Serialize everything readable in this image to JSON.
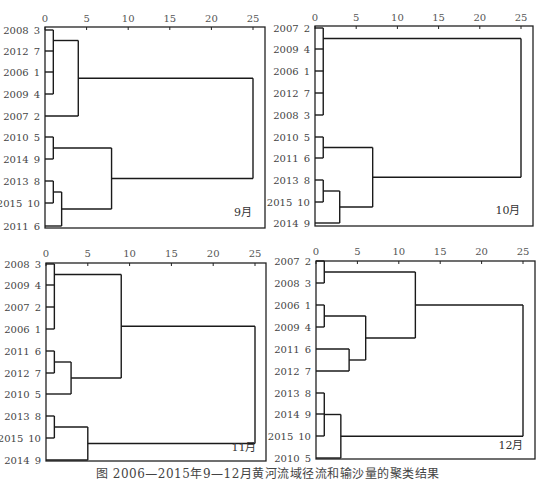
{
  "caption": "图 2006—2015年9—12月黄河流域径流和输沙量的聚类结果",
  "chart_data": [
    {
      "type": "dendrogram",
      "title": "9月",
      "axis_ticks": [
        0,
        5,
        10,
        15,
        20,
        25
      ],
      "xlim": [
        0,
        25
      ],
      "leaves": [
        {
          "year": "2008",
          "id": "3"
        },
        {
          "year": "2012",
          "id": "7"
        },
        {
          "year": "2006",
          "id": "1"
        },
        {
          "year": "2009",
          "id": "4"
        },
        {
          "year": "2007",
          "id": "2"
        },
        {
          "year": "2010",
          "id": "5"
        },
        {
          "year": "2014",
          "id": "9"
        },
        {
          "year": "2013",
          "id": "8"
        },
        {
          "year": "2015",
          "id": "10"
        },
        {
          "year": "2011",
          "id": "6"
        }
      ],
      "merges": [
        {
          "a": "L0",
          "b": "L1",
          "h": 1,
          "also": [
            "L2",
            "L3"
          ]
        },
        {
          "a": "M0",
          "b": "L4",
          "h": 4
        },
        {
          "a": "L5",
          "b": "L6",
          "h": 1
        },
        {
          "a": "L7",
          "b": "L8",
          "h": 1
        },
        {
          "a": "M3",
          "b": "L9",
          "h": 2
        },
        {
          "a": "M2",
          "b": "M4",
          "h": 8
        },
        {
          "a": "M1",
          "b": "M5",
          "h": 25
        }
      ]
    },
    {
      "type": "dendrogram",
      "title": "10月",
      "axis_ticks": [
        0,
        5,
        10,
        15,
        20,
        25
      ],
      "xlim": [
        0,
        25
      ],
      "leaves": [
        {
          "year": "2007",
          "id": "2"
        },
        {
          "year": "2009",
          "id": "4"
        },
        {
          "year": "2006",
          "id": "1"
        },
        {
          "year": "2012",
          "id": "7"
        },
        {
          "year": "2008",
          "id": "3"
        },
        {
          "year": "2010",
          "id": "5"
        },
        {
          "year": "2011",
          "id": "6"
        },
        {
          "year": "2013",
          "id": "8"
        },
        {
          "year": "2015",
          "id": "10"
        },
        {
          "year": "2014",
          "id": "9"
        }
      ],
      "merges": [
        {
          "a": "L0",
          "b": "L1",
          "h": 1,
          "also": [
            "L2",
            "L3",
            "L4"
          ]
        },
        {
          "a": "L5",
          "b": "L6",
          "h": 1
        },
        {
          "a": "L7",
          "b": "L8",
          "h": 1
        },
        {
          "a": "M2",
          "b": "L9",
          "h": 3
        },
        {
          "a": "M1",
          "b": "M3",
          "h": 7
        },
        {
          "a": "M0",
          "b": "M4",
          "h": 25
        }
      ]
    },
    {
      "type": "dendrogram",
      "title": "11月",
      "axis_ticks": [
        0,
        5,
        10,
        15,
        20,
        25
      ],
      "xlim": [
        0,
        25
      ],
      "leaves": [
        {
          "year": "2008",
          "id": "3"
        },
        {
          "year": "2009",
          "id": "4"
        },
        {
          "year": "2007",
          "id": "2"
        },
        {
          "year": "2006",
          "id": "1"
        },
        {
          "year": "2011",
          "id": "6"
        },
        {
          "year": "2012",
          "id": "7"
        },
        {
          "year": "2010",
          "id": "5"
        },
        {
          "year": "2013",
          "id": "8"
        },
        {
          "year": "2015",
          "id": "10"
        },
        {
          "year": "2014",
          "id": "9"
        }
      ],
      "merges": [
        {
          "a": "L0",
          "b": "L1",
          "h": 1,
          "also": [
            "L2",
            "L3"
          ]
        },
        {
          "a": "L4",
          "b": "L5",
          "h": 1
        },
        {
          "a": "M1",
          "b": "L6",
          "h": 3
        },
        {
          "a": "M0",
          "b": "M2",
          "h": 9
        },
        {
          "a": "L7",
          "b": "L8",
          "h": 1
        },
        {
          "a": "M4",
          "b": "L9",
          "h": 5
        },
        {
          "a": "M3",
          "b": "M5",
          "h": 25
        }
      ]
    },
    {
      "type": "dendrogram",
      "title": "12月",
      "axis_ticks": [
        0,
        5,
        10,
        15,
        20,
        25
      ],
      "xlim": [
        0,
        25
      ],
      "leaves": [
        {
          "year": "2007",
          "id": "2"
        },
        {
          "year": "2008",
          "id": "3"
        },
        {
          "year": "2006",
          "id": "1"
        },
        {
          "year": "2009",
          "id": "4"
        },
        {
          "year": "2011",
          "id": "6"
        },
        {
          "year": "2012",
          "id": "7"
        },
        {
          "year": "2013",
          "id": "8"
        },
        {
          "year": "2014",
          "id": "9"
        },
        {
          "year": "2015",
          "id": "10"
        },
        {
          "year": "2010",
          "id": "5"
        }
      ],
      "merges": [
        {
          "a": "L0",
          "b": "L1",
          "h": 1
        },
        {
          "a": "L2",
          "b": "L3",
          "h": 1
        },
        {
          "a": "L4",
          "b": "L5",
          "h": 4
        },
        {
          "a": "M1",
          "b": "M2",
          "h": 6
        },
        {
          "a": "M0",
          "b": "M3",
          "h": 12
        },
        {
          "a": "L6",
          "b": "L8",
          "h": 1,
          "also": [
            "L7"
          ]
        },
        {
          "a": "M5",
          "b": "L9",
          "h": 3
        },
        {
          "a": "M4",
          "b": "M6",
          "h": 25
        }
      ]
    }
  ],
  "layout": [
    {
      "x0": 45,
      "x25": 253,
      "right": 265,
      "top": 27,
      "bottom": 228,
      "axis_y": 22,
      "label_x": 40,
      "rows": [
        30,
        51,
        72,
        94,
        116,
        137,
        159,
        181,
        203,
        226
      ],
      "title_x": 243,
      "title_y": 216
    },
    {
      "x0": 315,
      "x25": 521,
      "right": 533,
      "top": 26,
      "bottom": 226,
      "axis_y": 21,
      "label_x": 310,
      "rows": [
        28,
        49,
        71,
        93,
        115,
        137,
        158,
        180,
        202,
        223
      ],
      "title_x": 508,
      "title_y": 214
    },
    {
      "x0": 46,
      "x25": 255,
      "right": 266,
      "top": 263,
      "bottom": 461,
      "axis_y": 257,
      "label_x": 41,
      "rows": [
        264,
        285,
        307,
        329,
        351,
        373,
        394,
        416,
        438,
        460
      ],
      "title_x": 244,
      "title_y": 451
    },
    {
      "x0": 316,
      "x25": 523,
      "right": 535,
      "top": 261,
      "bottom": 459,
      "axis_y": 255,
      "label_x": 311,
      "rows": [
        261,
        283,
        305,
        327,
        349,
        371,
        393,
        414,
        436,
        458
      ],
      "title_x": 511,
      "title_y": 449
    }
  ]
}
